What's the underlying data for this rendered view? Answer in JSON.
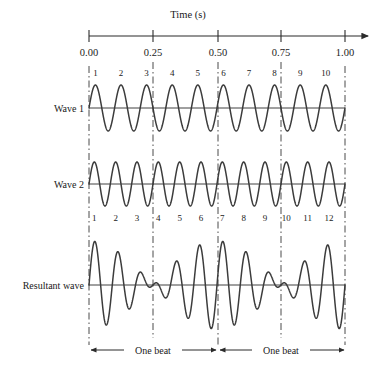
{
  "axis": {
    "title": "Time (s)",
    "ticks": [
      {
        "label": "0.00",
        "value": 0.0
      },
      {
        "label": "0.25",
        "value": 0.25
      },
      {
        "label": "0.50",
        "value": 0.5
      },
      {
        "label": "0.75",
        "value": 0.75
      },
      {
        "label": "1.00",
        "value": 1.0
      }
    ]
  },
  "labels": {
    "wave1": "Wave 1",
    "wave2": "Wave 2",
    "resultant": "Resultant wave",
    "beat_left": "One beat",
    "beat_right": "One beat"
  },
  "wave1_numbers": [
    "1",
    "2",
    "3",
    "4",
    "5",
    "6",
    "7",
    "8",
    "9",
    "10"
  ],
  "wave2_numbers": [
    "1",
    "2",
    "3",
    "4",
    "5",
    "6",
    "7",
    "8",
    "9",
    "10",
    "11",
    "12"
  ],
  "colors": {
    "curve": "#3c3c3c",
    "axis": "#2b2b2b",
    "baseline": "#2b2b2b",
    "dashed": "#4a4a4a"
  },
  "chart_data": {
    "type": "line",
    "xlabel": "Time (s)",
    "ylabel": "",
    "xlim": [
      0.0,
      1.0
    ],
    "grid": false,
    "legend": "none",
    "xticks": [
      0.0,
      0.25,
      0.5,
      0.75,
      1.0
    ],
    "xticklabels": [
      "0.00",
      "0.25",
      "0.50",
      "0.75",
      "1.00"
    ],
    "annotations": [
      {
        "text": "One beat",
        "x_start": 0.0,
        "x_end": 0.5
      },
      {
        "text": "One beat",
        "x_start": 0.5,
        "x_end": 1.0
      }
    ],
    "vertical_dashed_lines": [
      0.0,
      0.25,
      0.5,
      0.75,
      1.0
    ],
    "series": [
      {
        "name": "Wave 1",
        "frequency_hz": 10,
        "amplitude": 1,
        "cycles": 10,
        "cycle_labels": [
          "1",
          "2",
          "3",
          "4",
          "5",
          "6",
          "7",
          "8",
          "9",
          "10"
        ],
        "label_position": "above",
        "formula": "y = A sin(2*pi*10*t)"
      },
      {
        "name": "Wave 2",
        "frequency_hz": 12,
        "amplitude": 1,
        "cycles": 12,
        "cycle_labels": [
          "1",
          "2",
          "3",
          "4",
          "5",
          "6",
          "7",
          "8",
          "9",
          "10",
          "11",
          "12"
        ],
        "label_position": "below",
        "formula": "y = A sin(2*pi*12*t)"
      },
      {
        "name": "Resultant wave",
        "beat_frequency_hz": 2,
        "beats_shown": 2,
        "amplitude_max": 2,
        "formula": "y = A sin(2*pi*10*t) + A sin(2*pi*12*t)",
        "envelope": "2A cos(2*pi*1*t)",
        "nodes_at": [
          0.25,
          0.75
        ],
        "antinodes_at": [
          0.0,
          0.5,
          1.0
        ]
      }
    ]
  }
}
